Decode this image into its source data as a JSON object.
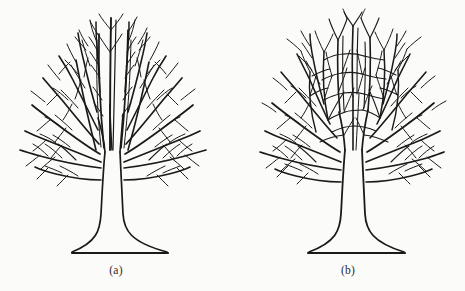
{
  "figure": {
    "background_color": "#fbfbfa",
    "ink_color": "#1a1a1a",
    "panels": [
      {
        "id": "a",
        "caption": "(a)",
        "subject": "leafless-tree-open-branching",
        "description": "Deciduous tree in winter with open, radiating fan-like branch architecture; branches fork repeatedly and taper to fine twigs without reconnecting.",
        "canopy": {
          "left_px": 18,
          "right_px": 210,
          "top_px": 10,
          "bottom_px": 192
        },
        "trunk": {
          "top_px": 150,
          "base_px": 253,
          "center_px": 112
        },
        "ground_line": {
          "x1_px": 72,
          "x2_px": 168,
          "y_px": 253
        }
      },
      {
        "id": "b",
        "caption": "(b)",
        "subject": "leafless-tree-anastomosing-branching",
        "description": "Deciduous tree in winter with dense interwoven crown; inner branches fuse and cross to form a net-like lattice of closed cells.",
        "canopy": {
          "left_px": 30,
          "right_px": 218,
          "top_px": 10,
          "bottom_px": 192
        },
        "trunk": {
          "top_px": 150,
          "base_px": 253,
          "center_px": 123
        },
        "ground_line": {
          "x1_px": 76,
          "x2_px": 173,
          "y_px": 253
        }
      }
    ]
  }
}
